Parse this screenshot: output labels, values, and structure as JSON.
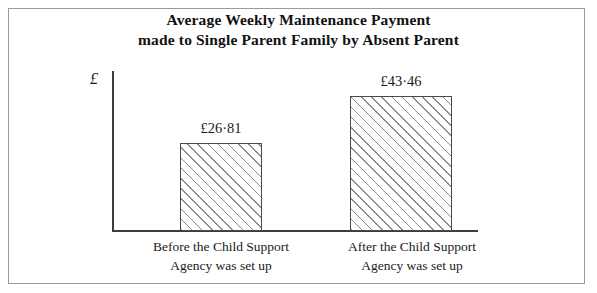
{
  "chart_data": {
    "type": "bar",
    "title": "Average Weekly Maintenance Payment made to Single Parent Family by Absent Parent",
    "title_lines": [
      "Average Weekly Maintenance Payment",
      "made to Single Parent Family by Absent Parent"
    ],
    "categories": [
      "Before the Child Support Agency was set up",
      "After the Child Support Agency was set up"
    ],
    "category_lines": [
      [
        "Before the Child Support",
        "Agency was set up"
      ],
      [
        "After the Child Support",
        "Agency was set up"
      ]
    ],
    "values": [
      26.81,
      43.46
    ],
    "value_labels": [
      "£26·81",
      "£43·46"
    ],
    "xlabel": "",
    "ylabel": "£",
    "ylim": [
      0,
      52
    ],
    "grid": false,
    "legend": false,
    "axis_ticks": false,
    "bar_fill": "diagonal-hatch",
    "colors": {
      "axis": "#3d3d3d",
      "bar_outline": "#4a4a4a",
      "hatch": "#8c8c8c",
      "text": "#1a1a1a",
      "frame": "#9a9a9a",
      "background": "#ffffff"
    }
  }
}
